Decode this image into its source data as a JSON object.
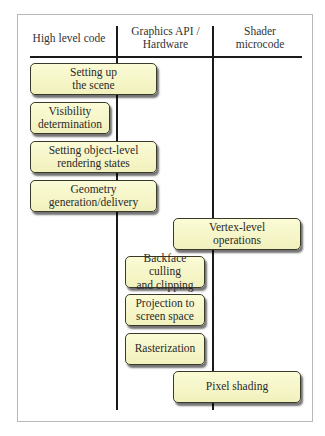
{
  "columns": [
    {
      "label": "High level code"
    },
    {
      "label": "Graphics API /\nHardware"
    },
    {
      "label": "Shader\nmicrocode"
    }
  ],
  "stages": [
    {
      "label": "Setting up\nthe scene",
      "column": "High level code"
    },
    {
      "label": "Visibility\ndetermination",
      "column": "High level code"
    },
    {
      "label": "Setting object-level\nrendering states",
      "column": "High level code"
    },
    {
      "label": "Geometry\ngeneration/delivery",
      "column": "High level code"
    },
    {
      "label": "Vertex-level\noperations",
      "column": "Shader microcode"
    },
    {
      "label": "Backface culling\nand clipping",
      "column": "Graphics API / Hardware"
    },
    {
      "label": "Projection to\nscreen space",
      "column": "Graphics API / Hardware"
    },
    {
      "label": "Rasterization",
      "column": "Graphics API / Hardware"
    },
    {
      "label": "Pixel shading",
      "column": "Shader microcode"
    }
  ],
  "colors": {
    "box_fill": "#f6f6c8",
    "box_border": "#3a3a2a",
    "line": "#1a1a1a",
    "frame": "#b8b8b8"
  }
}
